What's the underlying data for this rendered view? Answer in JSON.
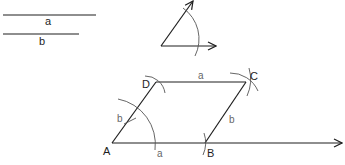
{
  "diagram": {
    "given_segments": {
      "a": {
        "label": "a",
        "length_px": 96
      },
      "b": {
        "label": "b",
        "length_px": 76
      }
    },
    "given_angle": {
      "description": "angle between two rays with arc mark"
    },
    "points": {
      "A": {
        "label": "A"
      },
      "B": {
        "label": "B"
      },
      "C": {
        "label": "C"
      },
      "D": {
        "label": "D"
      }
    },
    "side_labels": {
      "AB": "a",
      "DC": "a",
      "AD": "b",
      "BC": "b"
    },
    "colors": {
      "line": "#1e1e1e",
      "arc": "#555555",
      "side_label": "#666666"
    }
  }
}
